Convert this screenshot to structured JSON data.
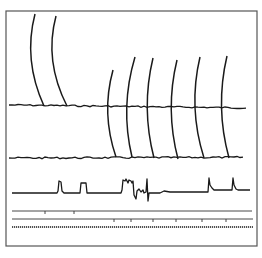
{
  "figure": {
    "colors": {
      "ink": "#1a1a1a",
      "frame": "#555555",
      "background": "#ffffff"
    },
    "frame": {
      "x": 6,
      "y": 11,
      "width": 251,
      "height": 235
    },
    "channels": [
      {
        "name": "trace-1",
        "baseline_y": 105,
        "x_start": 9,
        "x_end": 248,
        "arcs": [
          {
            "top_x": 35,
            "top_y": 14,
            "bottom_x": 44,
            "bottom_y": 106
          },
          {
            "top_x": 56,
            "top_y": 16,
            "bottom_x": 67,
            "bottom_y": 106
          }
        ]
      },
      {
        "name": "trace-2",
        "baseline_y": 158,
        "x_start": 9,
        "x_end": 245,
        "arcs": [
          {
            "top_x": 113,
            "top_y": 70,
            "bottom_x": 116,
            "bottom_y": 157
          },
          {
            "top_x": 135,
            "top_y": 57,
            "bottom_x": 132,
            "bottom_y": 157
          },
          {
            "top_x": 153,
            "top_y": 58,
            "bottom_x": 154,
            "bottom_y": 158
          },
          {
            "top_x": 177,
            "top_y": 60,
            "bottom_x": 178,
            "bottom_y": 159
          },
          {
            "top_x": 200,
            "top_y": 57,
            "bottom_x": 204,
            "bottom_y": 158
          },
          {
            "top_x": 227,
            "top_y": 56,
            "bottom_x": 229,
            "bottom_y": 158
          }
        ]
      },
      {
        "name": "trace-3",
        "baseline_y": 193,
        "x_start": 12,
        "x_end": 250
      }
    ],
    "marker_lines": [
      {
        "name": "event-line-1",
        "y": 211,
        "x_start": 12,
        "x_end": 252,
        "ticks_x": [
          45,
          74
        ]
      },
      {
        "name": "event-line-2",
        "y": 219,
        "x_start": 12,
        "x_end": 253,
        "ticks_x": [
          114,
          131,
          153,
          176,
          202,
          226
        ]
      },
      {
        "name": "time-marker-line",
        "y": 227,
        "x_start": 12,
        "x_end": 253,
        "dense": true
      }
    ]
  }
}
